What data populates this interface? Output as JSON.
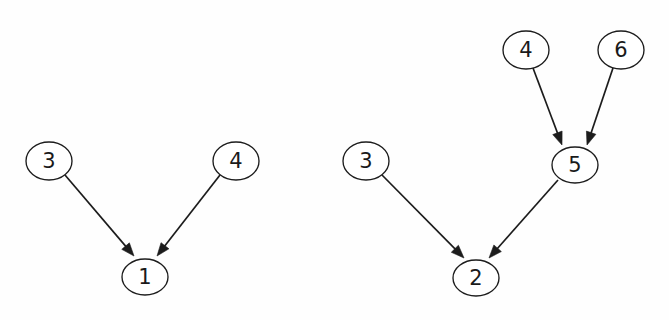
{
  "figure": {
    "background_color": "#fefefe",
    "ink_color": "#1c1c1c",
    "node_fill_color": "#ffffff",
    "width": 669,
    "height": 320,
    "graphs": [
      {
        "id": "left-graph",
        "name": "left-dag",
        "nodes": [
          {
            "id": "L3",
            "label": "3",
            "cx": 49,
            "cy": 161,
            "rx": 23,
            "ry": 19
          },
          {
            "id": "L4",
            "label": "4",
            "cx": 236,
            "cy": 161,
            "rx": 23,
            "ry": 19
          },
          {
            "id": "L1",
            "label": "1",
            "cx": 145,
            "cy": 277,
            "rx": 23,
            "ry": 18
          }
        ],
        "edges": [
          {
            "id": "L3-L1",
            "from": "3",
            "to": "1",
            "x1": 65,
            "y1": 175,
            "x2": 134,
            "y2": 256
          },
          {
            "id": "L4-L1",
            "from": "4",
            "to": "1",
            "x1": 220,
            "y1": 175,
            "x2": 157,
            "y2": 256
          }
        ]
      },
      {
        "id": "right-graph",
        "name": "right-dag",
        "nodes": [
          {
            "id": "R4",
            "label": "4",
            "cx": 526,
            "cy": 50,
            "rx": 23,
            "ry": 19
          },
          {
            "id": "R6",
            "label": "6",
            "cx": 621,
            "cy": 50,
            "rx": 23,
            "ry": 19
          },
          {
            "id": "R3",
            "label": "3",
            "cx": 366,
            "cy": 161,
            "rx": 23,
            "ry": 19
          },
          {
            "id": "R5",
            "label": "5",
            "cx": 575,
            "cy": 165,
            "rx": 23,
            "ry": 18
          },
          {
            "id": "R2",
            "label": "2",
            "cx": 476,
            "cy": 278,
            "rx": 23,
            "ry": 18
          }
        ],
        "edges": [
          {
            "id": "R4-R5",
            "from": "4",
            "to": "5",
            "x1": 533,
            "y1": 68,
            "x2": 562,
            "y2": 145
          },
          {
            "id": "R6-R5",
            "from": "6",
            "to": "5",
            "x1": 613,
            "y1": 68,
            "x2": 587,
            "y2": 145
          },
          {
            "id": "R3-R2",
            "from": "3",
            "to": "2",
            "x1": 382,
            "y1": 175,
            "x2": 464,
            "y2": 258
          },
          {
            "id": "R5-R2",
            "from": "5",
            "to": "2",
            "x1": 558,
            "y1": 180,
            "x2": 489,
            "y2": 258
          }
        ]
      }
    ]
  }
}
